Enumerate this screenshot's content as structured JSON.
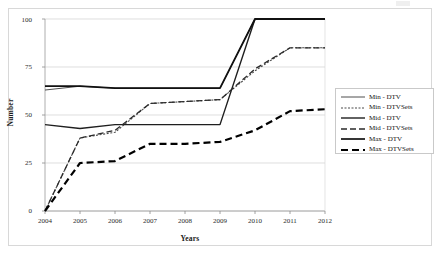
{
  "chart_data": {
    "type": "line",
    "title": "",
    "xlabel": "Years",
    "ylabel": "Number",
    "x": [
      2004,
      2005,
      2006,
      2007,
      2008,
      2009,
      2010,
      2011,
      2012
    ],
    "categories": [
      "2004",
      "2005",
      "2006",
      "2007",
      "2008",
      "2009",
      "2010",
      "2011",
      "2012"
    ],
    "xlim": [
      2004,
      2012
    ],
    "ylim": [
      0,
      100
    ],
    "yticks": [
      0,
      25,
      50,
      75,
      100
    ],
    "ytick_labels": [
      "0",
      "25",
      "50",
      "75",
      "100"
    ],
    "xtick_labels": [
      "2004",
      "2005",
      "2006",
      "2007",
      "2008",
      "2009",
      "2010",
      "2011",
      "2012"
    ],
    "grid": "horizontal",
    "legend_position": "right",
    "series": [
      {
        "name": "Min - DTV",
        "style": "solid-thin",
        "color": "#3a3a3a",
        "values": [
          63,
          65,
          64,
          64,
          64,
          64,
          100,
          100,
          100
        ]
      },
      {
        "name": "Min - DTVSets",
        "style": "dotted",
        "color": "#4a4a4a",
        "values": [
          0,
          38,
          41,
          56,
          57,
          58,
          73,
          85,
          85
        ]
      },
      {
        "name": "Mid - DTV",
        "style": "solid",
        "color": "#1f1f1f",
        "values": [
          45,
          43,
          45,
          45,
          45,
          45,
          100,
          100,
          100
        ]
      },
      {
        "name": "Mid - DTVSets",
        "style": "dashed",
        "color": "#2a2a2a",
        "values": [
          0,
          38,
          42,
          56,
          57,
          58,
          74,
          85,
          85
        ]
      },
      {
        "name": "Max - DTV",
        "style": "solid-thick",
        "color": "#111111",
        "values": [
          65,
          65,
          64,
          64,
          64,
          64,
          100,
          100,
          100
        ]
      },
      {
        "name": "Max - DTVSets",
        "style": "dashed-thick",
        "color": "#000000",
        "values": [
          0,
          25,
          26,
          35,
          35,
          36,
          42,
          52,
          53
        ]
      }
    ]
  },
  "legend": {
    "entries": [
      {
        "label": "Min - DTV"
      },
      {
        "label": "Min - DTVSets"
      },
      {
        "label": "Mid - DTV"
      },
      {
        "label": "Mid - DTVSets"
      },
      {
        "label": "Max - DTV"
      },
      {
        "label": "Max - DTVSets"
      }
    ]
  },
  "axes": {
    "y_title": "Number",
    "x_title": "Years"
  }
}
